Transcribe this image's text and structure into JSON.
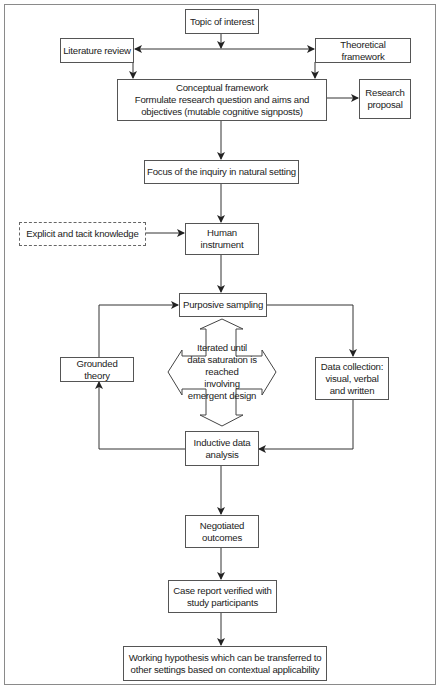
{
  "diagram": {
    "nodes": {
      "topic": "Topic of interest",
      "literature": "Literature review",
      "theoretical": "Theoretical framework",
      "conceptual": "Conceptual framework\nFormulate research question and aims and\nobjectives (mutable cognitive signposts)",
      "proposal": "Research\nproposal",
      "focus": "Focus of the inquiry in natural setting",
      "explicit": "Explicit and tacit knowledge",
      "human": "Human\ninstrument",
      "purposive": "Purposive sampling",
      "grounded": "Grounded theory",
      "iterated": "Iterated until\ndata saturation is\nreached\ninvolving\nemergent design",
      "datacollection": "Data collection:\nvisual, verbal\nand written",
      "inductive": "Inductive data\nanalysis",
      "negotiated": "Negotiated\noutcomes",
      "casereport": "Case report verified with\nstudy participants",
      "hypothesis": "Working hypothesis which can be transferred to\nother settings based on contextual applicability"
    },
    "edges": [
      {
        "from": "Topic of interest",
        "to": "Literature review"
      },
      {
        "from": "Topic of interest",
        "to": "Theoretical framework"
      },
      {
        "from": "Literature review",
        "to": "Conceptual framework"
      },
      {
        "from": "Theoretical framework",
        "to": "Conceptual framework"
      },
      {
        "from": "Conceptual framework",
        "to": "Research proposal"
      },
      {
        "from": "Conceptual framework",
        "to": "Focus of the inquiry in natural setting"
      },
      {
        "from": "Focus of the inquiry in natural setting",
        "to": "Human instrument"
      },
      {
        "from": "Explicit and tacit knowledge",
        "to": "Human instrument"
      },
      {
        "from": "Human instrument",
        "to": "Purposive sampling"
      },
      {
        "from": "Purposive sampling",
        "to": "Data collection"
      },
      {
        "from": "Data collection",
        "to": "Inductive data analysis"
      },
      {
        "from": "Inductive data analysis",
        "to": "Grounded theory"
      },
      {
        "from": "Grounded theory",
        "to": "Purposive sampling"
      },
      {
        "from": "Inductive data analysis",
        "to": "Negotiated outcomes"
      },
      {
        "from": "Negotiated outcomes",
        "to": "Case report verified with study participants"
      },
      {
        "from": "Case report verified with study participants",
        "to": "Working hypothesis"
      }
    ],
    "colors": {
      "line": "#222222",
      "border": "#555555",
      "frame": "#8a8a8a"
    }
  }
}
